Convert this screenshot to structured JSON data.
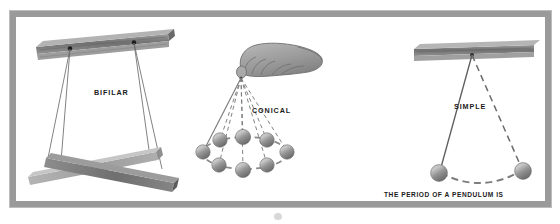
{
  "figure": {
    "title_label": "TYPES OF PENDULUMS",
    "background_color": "#ffffff",
    "frame_color": "#9a9a9a",
    "ink_color": "#595959",
    "text_color": "#1b1b1b",
    "bob_color": "#8e8e8e"
  },
  "panels": [
    {
      "id": "bifilar",
      "label": "BIFILAR",
      "description": "Two pairs of threads from a ceiling beam supporting crossed bars"
    },
    {
      "id": "conical",
      "label": "CONICAL",
      "description": "Hand holding a string whose bob sweeps a circular path drawn as eight positions"
    },
    {
      "id": "simple",
      "label": "SIMPLE",
      "description": "Single thread from a beam with bob shown at both ends of its swing"
    }
  ],
  "caption": {
    "lines": [
      "THE PERIOD OF A PENDULUM IS",
      "THE TIME OF ONE COMPLETE OSCILLATION",
      "BACK AND FORTH"
    ],
    "text": "THE PERIOD OF A PENDULUM IS\nTHE TIME OF ONE COMPLETE OSCILLATION\nBACK AND FORTH"
  }
}
